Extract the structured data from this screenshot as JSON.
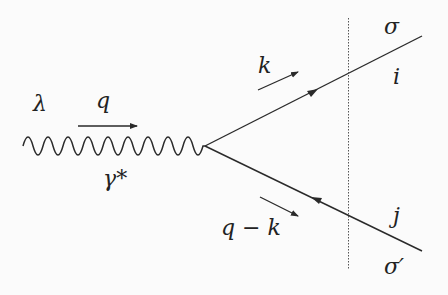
{
  "diagram": {
    "type": "feynman-diagram",
    "labels": {
      "photon_polarization": "λ",
      "photon_momentum": "q",
      "photon_name": "γ*",
      "quark_momentum": "k",
      "antiquark_momentum": "q − k",
      "quark_spin": "σ",
      "antiquark_spin": "σ′",
      "quark_color": "i",
      "antiquark_color": "j"
    },
    "colors": {
      "line": "#2a2a2a",
      "background": "#fbfbfb"
    }
  }
}
